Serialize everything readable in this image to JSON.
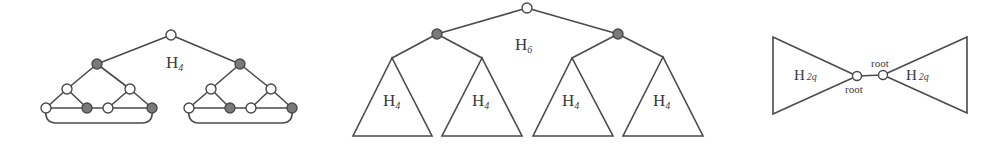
{
  "colors": {
    "stroke": "#4a4a4a",
    "gray_node": "#7a7a7a",
    "white_node": "#ffffff",
    "text": "#3a3a3a"
  },
  "figures": [
    {
      "id": "h4",
      "label": {
        "base": "H",
        "sub": "4"
      },
      "description": "Graph H4: root joined to two gray vertices, each heading a small subgraph"
    },
    {
      "id": "h6",
      "label": {
        "base": "H",
        "sub": "6"
      },
      "subtrees": [
        {
          "label": {
            "base": "H",
            "sub": "4"
          }
        },
        {
          "label": {
            "base": "H",
            "sub": "4"
          }
        },
        {
          "label": {
            "base": "H",
            "sub": "4"
          }
        },
        {
          "label": {
            "base": "H",
            "sub": "4"
          }
        }
      ]
    },
    {
      "id": "bowtie",
      "left": {
        "label": {
          "base": "H",
          "sub": "2q"
        },
        "root_label": "root"
      },
      "right": {
        "label": {
          "base": "H",
          "sub": "2q"
        },
        "root_label": "root"
      }
    }
  ]
}
